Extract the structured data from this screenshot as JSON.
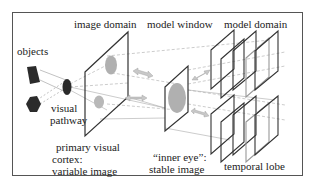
{
  "labels": {
    "image_domain": "image domain",
    "model_window": "model window",
    "model_domain": "model domain",
    "objects": "objects",
    "visual_pathway_1": "visual",
    "visual_pathway_2": "pathway",
    "primary_cortex_1": "primary visual",
    "primary_cortex_2": "cortex:",
    "primary_cortex_3": "variable image",
    "inner_eye_1": "“inner eye”:",
    "inner_eye_2": "stable image",
    "temporal_lobe": "temporal lobe"
  },
  "colors": {
    "frame": "#444444",
    "object_fill": "#2b2b2b",
    "image_blob": "#b0b0b0",
    "arrow_fill": "#c8c8c8",
    "dashed": "#aaaaaa",
    "plane_stroke": "#333333"
  }
}
